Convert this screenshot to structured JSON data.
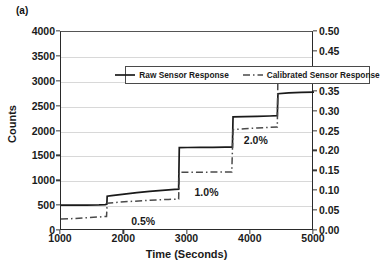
{
  "figure": {
    "panel_label": "(a)"
  },
  "legend": {
    "position": "inside-top",
    "items": [
      {
        "label": "Raw Sensor Response",
        "style": "solid",
        "color": "#1a1a1a"
      },
      {
        "label": "Calibrated Sensor Response",
        "style": "dashed",
        "color": "#4a4a4a"
      }
    ]
  },
  "chart_data": {
    "type": "line",
    "title": "",
    "subtitle": "",
    "xlabel": "Time (Seconds)",
    "ylabel": "Counts",
    "y2label": "H2 Partial Pressure x 10 (psia)",
    "xlim": [
      1000,
      5000
    ],
    "ylim": [
      0,
      4000
    ],
    "y2lim": [
      0.0,
      0.5
    ],
    "xticks": [
      1000,
      2000,
      3000,
      4000,
      5000
    ],
    "xticklabels": [
      "1000",
      "2000",
      "3000",
      "4000",
      "5000"
    ],
    "yticks": [
      0,
      500,
      1000,
      1500,
      2000,
      2500,
      3000,
      3500,
      4000
    ],
    "yticklabels": [
      "0",
      "500",
      "1000",
      "1500",
      "2000",
      "2500",
      "3000",
      "3500",
      "4000"
    ],
    "y2ticks": [
      0.0,
      0.05,
      0.1,
      0.15,
      0.2,
      0.25,
      0.3,
      0.35,
      0.4,
      0.45,
      0.5
    ],
    "y2ticklabels": [
      "0.00",
      "0.05",
      "0.10",
      "0.15",
      "0.20",
      "0.25",
      "0.30",
      "0.35",
      "0.40",
      "0.45",
      "0.50"
    ],
    "grid": "horizontal",
    "series": [
      {
        "name": "Raw Sensor Response",
        "style": "solid",
        "color": "#1a1a1a",
        "points": [
          [
            1000,
            520
          ],
          [
            1200,
            520
          ],
          [
            1400,
            522
          ],
          [
            1600,
            525
          ],
          [
            1700,
            530
          ],
          [
            1725,
            540
          ],
          [
            1730,
            700
          ],
          [
            1800,
            710
          ],
          [
            2000,
            740
          ],
          [
            2200,
            770
          ],
          [
            2400,
            795
          ],
          [
            2600,
            815
          ],
          [
            2800,
            835
          ],
          [
            2860,
            842
          ],
          [
            2870,
            1675
          ],
          [
            3000,
            1678
          ],
          [
            3200,
            1680
          ],
          [
            3400,
            1682
          ],
          [
            3600,
            1684
          ],
          [
            3710,
            1686
          ],
          [
            3720,
            2295
          ],
          [
            3900,
            2300
          ],
          [
            4100,
            2305
          ],
          [
            4300,
            2312
          ],
          [
            4420,
            2318
          ],
          [
            4430,
            2760
          ],
          [
            4600,
            2775
          ],
          [
            4800,
            2785
          ],
          [
            5000,
            2790
          ],
          [
            5060,
            2792
          ]
        ]
      },
      {
        "name": "Calibrated Sensor Response",
        "style": "dashed",
        "color": "#4a4a4a",
        "points": [
          [
            1000,
            240
          ],
          [
            1200,
            250
          ],
          [
            1400,
            265
          ],
          [
            1600,
            282
          ],
          [
            1720,
            292
          ],
          [
            1730,
            560
          ],
          [
            1900,
            578
          ],
          [
            2100,
            595
          ],
          [
            2300,
            610
          ],
          [
            2500,
            625
          ],
          [
            2700,
            635
          ],
          [
            2860,
            642
          ],
          [
            2870,
            1180
          ],
          [
            3100,
            1182
          ],
          [
            3400,
            1184
          ],
          [
            3700,
            1186
          ],
          [
            3720,
            2040
          ],
          [
            3900,
            2055
          ],
          [
            4100,
            2070
          ],
          [
            4300,
            2082
          ],
          [
            4420,
            2090
          ],
          [
            4430,
            3255
          ],
          [
            4600,
            3265
          ],
          [
            4800,
            3250
          ],
          [
            5000,
            3258
          ],
          [
            5060,
            3258
          ]
        ]
      }
    ],
    "annotations": [
      {
        "text": "0.5%",
        "x": 2300,
        "y": 185
      },
      {
        "text": "1.0%",
        "x": 3300,
        "y": 760
      },
      {
        "text": "2.0%",
        "x": 4080,
        "y": 1810
      },
      {
        "text": "3.0%",
        "x": 4780,
        "y": 3080
      }
    ]
  }
}
